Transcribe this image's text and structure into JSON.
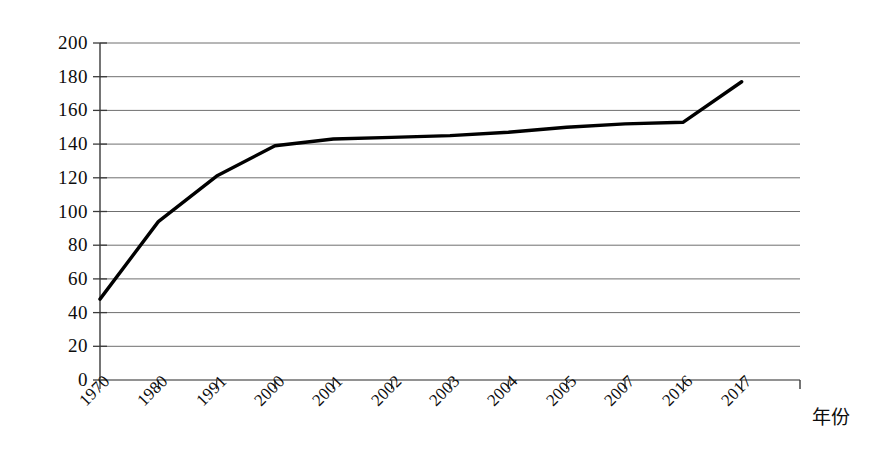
{
  "chart_data": {
    "type": "line",
    "title": "",
    "subtitle": "",
    "xlabel": "年份",
    "ylabel": "",
    "categories": [
      "1970",
      "1980",
      "1991",
      "2000",
      "2001",
      "2002",
      "2003",
      "2004",
      "2005",
      "2007",
      "2016",
      "2017"
    ],
    "values": [
      48,
      94,
      121,
      139,
      143,
      144,
      145,
      147,
      150,
      152,
      153,
      177
    ],
    "ylim": [
      0,
      200
    ],
    "yticks": [
      "0",
      "20",
      "40",
      "60",
      "80",
      "100",
      "120",
      "140",
      "160",
      "180",
      "200"
    ],
    "ytick_values": [
      0,
      20,
      40,
      60,
      80,
      100,
      120,
      140,
      160,
      180,
      200
    ],
    "grid": true,
    "legend": [],
    "legend_position": "none",
    "series": [
      {
        "name": "",
        "values": [
          48,
          94,
          121,
          139,
          143,
          144,
          145,
          147,
          150,
          152,
          153,
          177
        ],
        "color": "#000000"
      }
    ],
    "annotations": [],
    "colors": {
      "line": "#000000",
      "grid": "#6f6f6f",
      "axis": "#3a3a3a",
      "background": "#ffffff",
      "text": "#0d0d0d"
    }
  }
}
